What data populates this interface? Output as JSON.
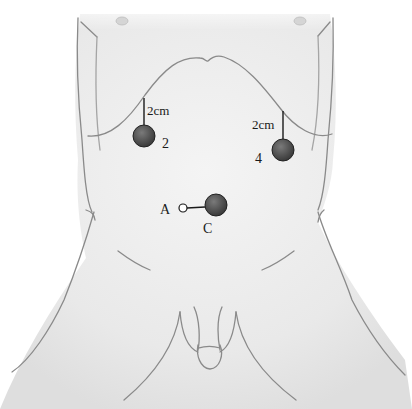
{
  "figure": {
    "colors": {
      "background": "#ffffff",
      "skin": "#ececec",
      "outline": "#8a8a8a",
      "port_fill": "#4a4a4a",
      "port_highlight": "#7a7a7a",
      "label": "#1a1a1a"
    },
    "ports": [
      {
        "id": "port-2",
        "number_label": "2",
        "distance_label": "2cm",
        "cx": 144,
        "cy": 136,
        "r": 11
      },
      {
        "id": "port-4",
        "number_label": "4",
        "distance_label": "2cm",
        "cx": 283,
        "cy": 150,
        "r": 11
      },
      {
        "id": "port-C",
        "letter_label": "C",
        "cx": 216,
        "cy": 205,
        "r": 11
      }
    ],
    "marker_A": {
      "letter_label": "A",
      "cx": 183,
      "cy": 208,
      "r": 4
    },
    "measure_lines": [
      {
        "for": "port-2",
        "x": 144,
        "y1": 98,
        "y2": 125
      },
      {
        "for": "port-4",
        "x": 283,
        "y1": 111,
        "y2": 139
      }
    ]
  }
}
